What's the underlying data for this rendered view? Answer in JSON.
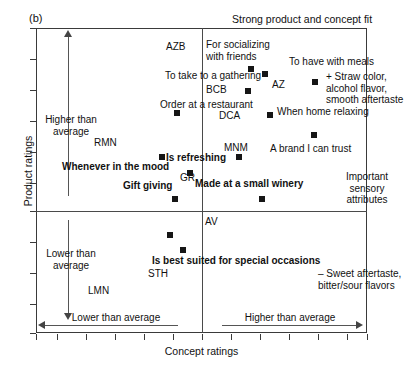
{
  "panel": {
    "label": "(b)"
  },
  "header": {
    "note": "Strong product and concept fit"
  },
  "axes": {
    "xlabel": "Concept ratings",
    "ylabel": "Product ratings",
    "x_low_label": "Lower than average",
    "x_high_label": "Higher than average",
    "y_high_label": "Higher than\naverage",
    "y_low_label": "Lower than\naverage"
  },
  "side_notes": {
    "sensory_positive": "+ Straw color,\nalcohol flavor,\nsmooth aftertaste",
    "sensory_title": "Important\nsensory\nattributes",
    "sensory_negative": "– Sweet aftertaste,\nbitter/sour flavors"
  },
  "chart_data": {
    "type": "scatter",
    "title": "Strong product and concept fit",
    "xlabel": "Concept ratings",
    "ylabel": "Product ratings",
    "xlim": [
      0,
      100
    ],
    "ylim": [
      0,
      100
    ],
    "grid": false,
    "legend": "none",
    "quadrant_divider_x": 50,
    "quadrant_divider_y": 60,
    "points": [
      {
        "label": "For socializing with friends",
        "code": "",
        "x": 64,
        "y": 87,
        "bold": false
      },
      {
        "label": "",
        "code": "AZ",
        "x": 69,
        "y": 85,
        "bold": false
      },
      {
        "label": "To take to a gathering",
        "code": "",
        "x": 63,
        "y": 80,
        "bold": false
      },
      {
        "label": "To have with meals",
        "code": "",
        "x": 86,
        "y": 80,
        "bold": false
      },
      {
        "label": "Order at a restaurant",
        "code": "",
        "x": 47,
        "y": 70,
        "bold": false
      },
      {
        "label": "When home relaxing",
        "code": "",
        "x": 79,
        "y": 70,
        "bold": false
      },
      {
        "label": "A brand I can trust",
        "code": "",
        "x": 84,
        "y": 60,
        "bold": false
      },
      {
        "label": "Whenever in the mood",
        "code": "",
        "x": 38,
        "y": 52,
        "bold": true
      },
      {
        "label": "MNM",
        "code": "MNM",
        "x": 60,
        "y": 51,
        "bold": false
      },
      {
        "label": "Is refreshing",
        "code": "GR",
        "x": 46,
        "y": 45,
        "bold": true
      },
      {
        "label": "Gift giving",
        "code": "",
        "x": 41,
        "y": 33,
        "bold": true
      },
      {
        "label": "Made at a small winery",
        "code": "",
        "x": 67,
        "y": 33,
        "bold": true
      },
      {
        "label": "",
        "code": "AV",
        "x": 39,
        "y": 21,
        "bold": false
      },
      {
        "label": "Is best suited for special occasions",
        "code": "STH",
        "x": 43,
        "y": 16,
        "bold": true
      }
    ],
    "code_labels": [
      "AZB",
      "BCB",
      "DCA",
      "AZ",
      "MNM",
      "GR",
      "RMN",
      "AV",
      "STH",
      "LMN"
    ],
    "annotations": [
      "Strong product and concept fit",
      "+ Straw color, alcohol flavor, smooth aftertaste",
      "Important sensory attributes",
      "– Sweet aftertaste, bitter/sour flavors",
      "Higher than average",
      "Lower than average"
    ]
  },
  "markers": [
    {
      "name": "marker-for-socializing",
      "x": 248,
      "y": 66
    },
    {
      "name": "marker-az",
      "x": 262,
      "y": 71
    },
    {
      "name": "marker-to-have-with-meals",
      "x": 312,
      "y": 79
    },
    {
      "name": "marker-bcb",
      "x": 245,
      "y": 88
    },
    {
      "name": "marker-order-at-restaurant",
      "x": 174,
      "y": 110
    },
    {
      "name": "marker-when-home-relaxing",
      "x": 267,
      "y": 112
    },
    {
      "name": "marker-brand-i-can-trust",
      "x": 311,
      "y": 132
    },
    {
      "name": "marker-whenever-in-the-mood",
      "x": 159,
      "y": 154
    },
    {
      "name": "marker-mnm",
      "x": 236,
      "y": 154
    },
    {
      "name": "marker-gr",
      "x": 187,
      "y": 170
    },
    {
      "name": "marker-gift-giving",
      "x": 172,
      "y": 196
    },
    {
      "name": "marker-made-at-small-winery",
      "x": 259,
      "y": 196
    },
    {
      "name": "marker-av",
      "x": 167,
      "y": 232
    },
    {
      "name": "marker-sth",
      "x": 180,
      "y": 247
    }
  ],
  "labels": {
    "azb": "AZB",
    "for_socializing": "For socializing\nwith friends",
    "to_have_with_meals": "To have with meals",
    "to_take_to_gathering": "To take to a gathering",
    "az": "AZ",
    "bcb": "BCB",
    "order_at_restaurant": "Order at a restaurant",
    "dca": "DCA",
    "when_home_relaxing": "When home relaxing",
    "rmn": "RMN",
    "mnm": "MNM",
    "brand_i_can_trust": "A brand I can trust",
    "whenever_in_the_mood": "Whenever in the mood",
    "is_refreshing": "Is refreshing",
    "gr": "GR",
    "gift_giving": "Gift giving",
    "made_at_small_winery": "Made at a small winery",
    "av": "AV",
    "is_best_suited": "Is best suited for special occasions",
    "sth": "STH",
    "lmn": "LMN"
  }
}
